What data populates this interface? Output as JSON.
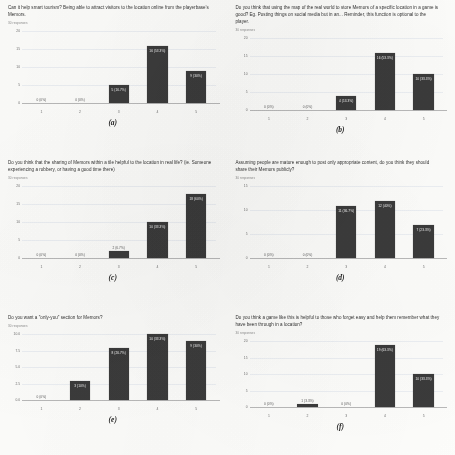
{
  "document": {
    "kind": "survey-results-figure",
    "layout": "2-columns x 3-rows",
    "background_color": "#fdfdfb",
    "bar_color": "#3b3b3b",
    "gridline_color": "#eceff3"
  },
  "charts": [
    {
      "caption": "(a)",
      "title": "Can it help smart tourism? Being able to attract visitors to the location online from the playerbase’s Memors.",
      "responses": "30 responses",
      "chart_data": {
        "type": "bar",
        "title": "Can it help smart tourism? Being able to attract visitors to the location online from the playerbase’s Memors.",
        "xlabel": "",
        "ylabel": "",
        "categories": [
          "1",
          "2",
          "3",
          "4",
          "5"
        ],
        "values": [
          0,
          0,
          5,
          16,
          9
        ],
        "data_labels": [
          "0 (0%)",
          "0 (0%)",
          "5 (16.7%)",
          "16 (53.3%)",
          "9 (30%)"
        ],
        "yticks": [
          "0",
          "5",
          "10",
          "15",
          "20"
        ],
        "ylim": [
          0,
          20
        ],
        "grid": true,
        "legend": "none"
      }
    },
    {
      "caption": "(b)",
      "title": "Do you think that using the map of the real world to store Memors of a specific location in a game is good? Eg. Posting things on social media but in an... Reminder, this function is optional to the player.",
      "responses": "30 responses",
      "chart_data": {
        "type": "bar",
        "title": "Do you think that using the map of the real world to store Memors of a specific location in a game is good? Eg. Posting things on social media but in an... Reminder, this function is optional to the player.",
        "xlabel": "",
        "ylabel": "",
        "categories": [
          "1",
          "2",
          "3",
          "4",
          "5"
        ],
        "values": [
          0,
          0,
          4,
          16,
          10
        ],
        "data_labels": [
          "0 (0%)",
          "0 (0%)",
          "4 (13.3%)",
          "16 (53.3%)",
          "10 (33.3%)"
        ],
        "yticks": [
          "0",
          "5",
          "10",
          "15",
          "20"
        ],
        "ylim": [
          0,
          20
        ],
        "grid": true,
        "legend": "none"
      }
    },
    {
      "caption": "(c)",
      "title": "Do you think that the sharing of Memors within a tile helpful to the location in real life? (ie. Someone experiencing a robbery, or having a good time there)",
      "responses": "30 responses",
      "chart_data": {
        "type": "bar",
        "title": "Do you think that the sharing of Memors within a tile helpful to the location in real life? (ie. Someone experiencing a robbery, or having a good time there)",
        "xlabel": "",
        "ylabel": "",
        "categories": [
          "1",
          "2",
          "3",
          "4",
          "5"
        ],
        "values": [
          0,
          0,
          2,
          10,
          18
        ],
        "data_labels": [
          "0 (0%)",
          "0 (0%)",
          "2 (6.7%)",
          "10 (33.3%)",
          "18 (60%)"
        ],
        "yticks": [
          "0",
          "5",
          "10",
          "15",
          "20"
        ],
        "ylim": [
          0,
          20
        ],
        "grid": true,
        "legend": "none"
      }
    },
    {
      "caption": "(d)",
      "title": "Assuming people are mature enough to post only appropriate content, do you think they should share their Memors publicly?",
      "responses": "30 responses",
      "chart_data": {
        "type": "bar",
        "title": "Assuming people are mature enough to post only appropriate content, do you think they should share their Memors publicly?",
        "xlabel": "",
        "ylabel": "",
        "categories": [
          "1",
          "2",
          "3",
          "4",
          "5"
        ],
        "values": [
          0,
          0,
          11,
          12,
          7
        ],
        "data_labels": [
          "0 (0%)",
          "0 (0%)",
          "11 (36.7%)",
          "12 (40%)",
          "7 (23.3%)"
        ],
        "yticks": [
          "0",
          "5",
          "10",
          "15"
        ],
        "ylim": [
          0,
          15
        ],
        "grid": true,
        "legend": "none"
      }
    },
    {
      "caption": "(e)",
      "title": "Do you want a \"only-you\" section for Memors?",
      "responses": "30 responses",
      "chart_data": {
        "type": "bar",
        "title": "Do you want a \"only-you\" section for Memors?",
        "xlabel": "",
        "ylabel": "",
        "categories": [
          "1",
          "2",
          "3",
          "4",
          "5"
        ],
        "values": [
          0,
          3,
          8,
          10,
          9
        ],
        "data_labels": [
          "0 (0%)",
          "3 (10%)",
          "8 (26.7%)",
          "10 (33.3%)",
          "9 (30%)"
        ],
        "yticks": [
          "0.0",
          "2.5",
          "5.0",
          "7.5",
          "10.0"
        ],
        "ylim": [
          0,
          10
        ],
        "grid": true,
        "legend": "none"
      }
    },
    {
      "caption": "(f)",
      "title": "Do you think a game like this is helpful to those who forget easy and help them remember what they have been through in a location?",
      "responses": "30 responses",
      "chart_data": {
        "type": "bar",
        "title": "Do you think a game like this is helpful to those who forget easy and help them remember what they have been through in a location?",
        "xlabel": "",
        "ylabel": "",
        "categories": [
          "1",
          "2",
          "3",
          "4",
          "5"
        ],
        "values": [
          0,
          1,
          0,
          19,
          10
        ],
        "data_labels": [
          "0 (0%)",
          "1 (3.3%)",
          "0 (0%)",
          "19 (63.3%)",
          "10 (33.3%)"
        ],
        "yticks": [
          "0",
          "5",
          "10",
          "15",
          "20"
        ],
        "ylim": [
          0,
          20
        ],
        "grid": true,
        "legend": "none"
      }
    }
  ]
}
